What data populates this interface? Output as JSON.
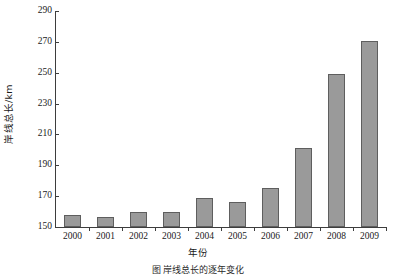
{
  "chart_data": {
    "type": "bar",
    "title": "",
    "xlabel": "年份",
    "ylabel": "岸线总长/km",
    "categories": [
      "2000",
      "2001",
      "2002",
      "2003",
      "2004",
      "2005",
      "2006",
      "2007",
      "2008",
      "2009"
    ],
    "values": [
      157.5,
      156.5,
      159.5,
      160.0,
      168.5,
      166.5,
      175.5,
      201.0,
      249.0,
      270.5
    ],
    "series": [
      {
        "name": "岸线总长",
        "values": [
          157.5,
          156.5,
          159.5,
          160.0,
          168.5,
          166.5,
          175.5,
          201.0,
          249.0,
          270.5
        ]
      }
    ],
    "ylim": [
      150,
      290
    ],
    "yticks": [
      150,
      170,
      190,
      210,
      230,
      250,
      270,
      290
    ],
    "ytick_labels": [
      "150",
      "170",
      "190",
      "210",
      "230",
      "250",
      "270",
      "290"
    ],
    "grid": false,
    "legend": false,
    "legend_position": "none",
    "bar_color": "#9a9a9a",
    "bar_edge_color": "#5e5e5e",
    "axis_color": "#3d3d3d"
  },
  "caption": "图          岸线总长的逐年变化"
}
